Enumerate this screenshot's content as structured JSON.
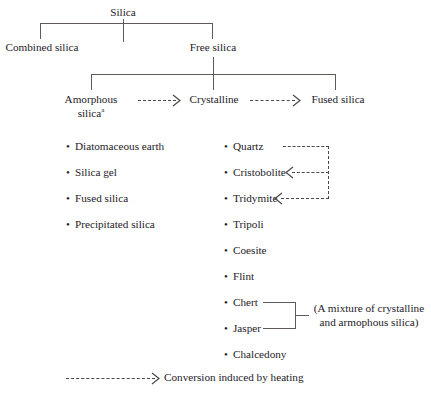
{
  "diagram": {
    "line_color": "#5d5a57",
    "dash_color": "#4a4745",
    "text_color": "#24211f",
    "background": "#ffffff"
  },
  "tree": {
    "root": {
      "label": "Silica"
    },
    "level2": [
      {
        "label": "Combined silica"
      },
      {
        "label": "Free silica"
      }
    ],
    "level3": [
      {
        "label_line1": "Amorphous",
        "label_line2": "silica",
        "superscript": "a"
      },
      {
        "label": "Crystalline"
      },
      {
        "label": "Fused silica"
      }
    ]
  },
  "amorphous_list": {
    "items": [
      "Diatomaceous earth",
      "Silica gel",
      "Fused silica",
      "Precipitated silica"
    ]
  },
  "crystalline_list": {
    "items": [
      "Quartz",
      "Cristobolite",
      "Tridymite",
      "Tripoli",
      "Coesite",
      "Flint",
      "Chert",
      "Jasper",
      "Chalcedony"
    ]
  },
  "annotations": {
    "mixture_note_line1": "(A mixture of crystalline",
    "mixture_note_line2": "and armophous silica)"
  },
  "legend": {
    "label": "Conversion induced by heating"
  },
  "icons": {
    "bullet": "•",
    "arrow_right": "arrow-right-icon",
    "arrow_left": "arrow-left-icon"
  }
}
